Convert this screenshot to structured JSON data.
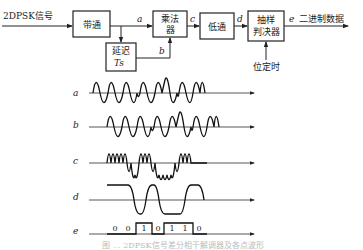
{
  "diagram": {
    "input_label": "2DPSK信号",
    "output_label": "二进制数据",
    "timing_label": "位定时",
    "blocks": [
      {
        "id": "bandpass",
        "lines": [
          "带通"
        ]
      },
      {
        "id": "delay",
        "lines": [
          "延迟",
          "Ts"
        ]
      },
      {
        "id": "multiplier",
        "lines": [
          "乘法",
          "器"
        ]
      },
      {
        "id": "lowpass",
        "lines": [
          "低通"
        ]
      },
      {
        "id": "sampler",
        "lines": [
          "抽样",
          "判决器"
        ]
      }
    ],
    "node_labels": {
      "a": "a",
      "b": "b",
      "c": "c",
      "d": "d",
      "e": "e"
    }
  },
  "waveforms": {
    "rows": [
      {
        "label": "a"
      },
      {
        "label": "b"
      },
      {
        "label": "c"
      },
      {
        "label": "d"
      },
      {
        "label": "e"
      }
    ],
    "bits": [
      "0",
      "0",
      "1",
      "0",
      "1",
      "1",
      "0"
    ]
  },
  "caption": "图 ... 2DPSK信号差分相干解调器及各点波形"
}
